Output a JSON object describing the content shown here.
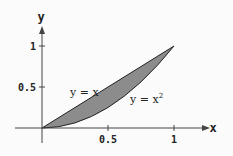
{
  "diagram": {
    "axes": {
      "x_label": "x",
      "y_label": "y"
    },
    "x_ticks": [
      "0.5",
      "1"
    ],
    "y_ticks": [
      "0.5",
      "1"
    ],
    "curves": [
      {
        "label": "y = x",
        "equation": "y=x"
      },
      {
        "label": "y = x",
        "superscript": "2",
        "equation": "y=x^2"
      }
    ],
    "shaded_region": {
      "between": [
        "y=x",
        "y=x^2"
      ],
      "x_range": [
        0,
        1
      ],
      "fill": "#8c8c8c"
    }
  }
}
